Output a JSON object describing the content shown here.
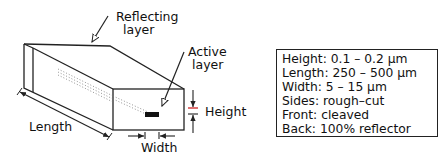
{
  "diagram": {
    "labels": {
      "reflecting_layer_line1": "Reflecting",
      "reflecting_layer_line2": "layer",
      "active_layer_line1": "Active",
      "active_layer_line2": "layer",
      "height": "Height",
      "length": "Length",
      "width": "Width"
    },
    "colors": {
      "line": "#222222",
      "height_marker": "#cc2222",
      "active_layer": "#111111"
    }
  },
  "specs": {
    "lines": [
      "Height: 0.1 – 0.2 μm",
      "Length: 250 – 500 μm",
      "Width: 5 – 15 μm",
      "Sides: rough–cut",
      "Front: cleaved",
      "Back: 100% reflector"
    ]
  }
}
